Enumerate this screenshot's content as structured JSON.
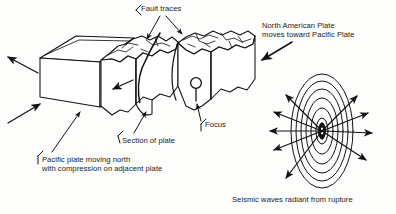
{
  "figure": {
    "title_visible": false,
    "background_color": "#fdfdfb",
    "ink_color": "#121212",
    "type": "geology-block-diagram"
  },
  "labels": {
    "fault_traces": "Fault traces",
    "north_american_plate": "North American Plate\nmoves toward Pacific Plate",
    "section_of_plate": "Section of plate",
    "pacific_plate": "Pacific plate moving north\nwith compression on adjacent plate",
    "focus": "Focus",
    "seismic_waves": "Seismic waves radiant from rupture"
  },
  "elements": {
    "block_left": "fault-block-left",
    "block_middle": "fault-block-middle",
    "block_right": "fault-block-right",
    "focus_marker": "focus-circle-marker",
    "wave_center": "rupture-focus-ellipse",
    "wavefronts_count": 7,
    "radiating_arrows_count": 9,
    "motion_arrows": [
      "arrow-northwest-pacific-plate",
      "arrow-northeast-pacific-plate",
      "arrow-southwest-compression",
      "arrow-north-american-plate-southwest",
      "arrow-interior-compression"
    ]
  }
}
